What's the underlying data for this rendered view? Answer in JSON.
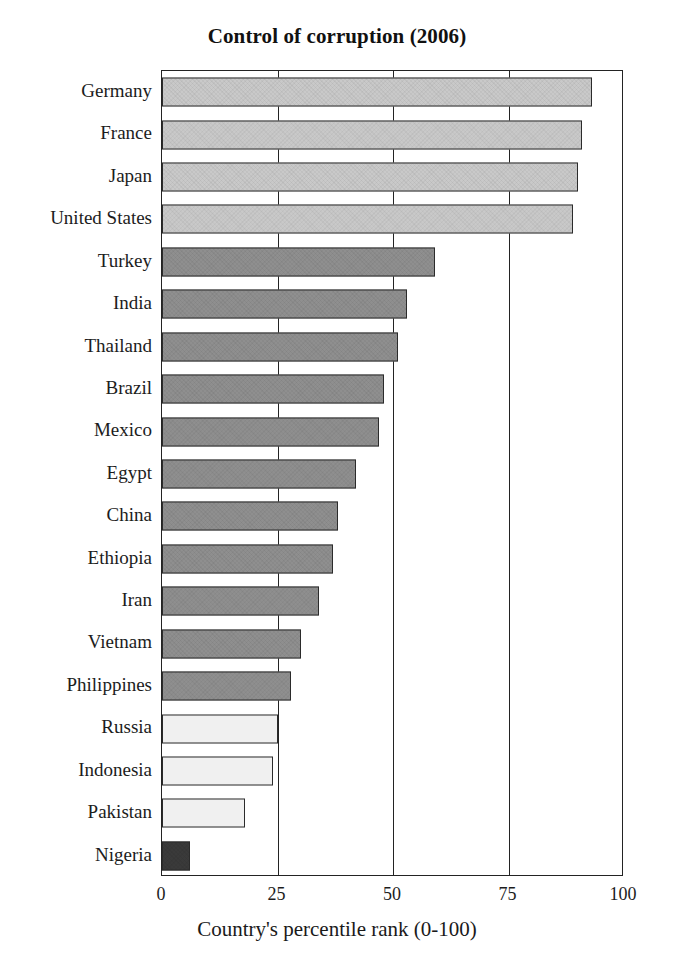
{
  "chart_data": {
    "type": "bar",
    "orientation": "horizontal",
    "title": "Control of corruption (2006)",
    "xlabel": "Country's percentile rank (0-100)",
    "ylabel": "",
    "xlim": [
      0,
      100
    ],
    "xticks": [
      0,
      25,
      50,
      75,
      100
    ],
    "xtick_labels": [
      "0",
      "25",
      "50",
      "75",
      "100"
    ],
    "grid": "vertical gridlines at 25, 50, 75",
    "legend": "none",
    "categories": [
      "Germany",
      "France",
      "Japan",
      "United States",
      "Turkey",
      "India",
      "Thailand",
      "Brazil",
      "Mexico",
      "Egypt",
      "China",
      "Ethiopia",
      "Iran",
      "Vietnam",
      "Philippines",
      "Russia",
      "Indonesia",
      "Pakistan",
      "Nigeria"
    ],
    "values": [
      93,
      91,
      90,
      89,
      59,
      53,
      51,
      48,
      47,
      42,
      38,
      37,
      34,
      30,
      28,
      25,
      24,
      18,
      6
    ],
    "bar_colors": [
      "#c9c9c9",
      "#c9c9c9",
      "#c9c9c9",
      "#c9c9c9",
      "#8f8f8f",
      "#8f8f8f",
      "#8f8f8f",
      "#8f8f8f",
      "#8f8f8f",
      "#8f8f8f",
      "#8f8f8f",
      "#8f8f8f",
      "#8f8f8f",
      "#8f8f8f",
      "#8f8f8f",
      "#f0f0f0",
      "#f0f0f0",
      "#f0f0f0",
      "#3a3a3a"
    ],
    "bar_edge_color": "#2b2b2b",
    "axis_color": "#232323",
    "background": "#ffffff"
  }
}
